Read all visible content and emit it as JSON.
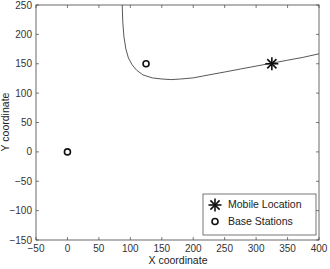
{
  "chart_data": {
    "type": "scatter",
    "title": "",
    "xlabel": "X coordinate",
    "ylabel": "Y coordinate",
    "xlim": [
      -50,
      400
    ],
    "ylim": [
      -150,
      250
    ],
    "xticks": [
      -50,
      0,
      50,
      100,
      150,
      200,
      250,
      300,
      350,
      400
    ],
    "yticks": [
      -150,
      -100,
      -50,
      0,
      50,
      100,
      150,
      200,
      250
    ],
    "xtick_labels": [
      "−50",
      "0",
      "50",
      "100",
      "150",
      "200",
      "250",
      "300",
      "350",
      "400"
    ],
    "ytick_labels": [
      "−150",
      "−100",
      "−50",
      "0",
      "50",
      "100",
      "150",
      "200",
      "250"
    ],
    "grid": false,
    "legend_position": "lower right",
    "series": [
      {
        "name": "Mobile Location",
        "marker": "asterisk",
        "color": "#111111",
        "points": [
          [
            325,
            150
          ]
        ]
      },
      {
        "name": "Base Stations",
        "marker": "circle-open",
        "color": "#111111",
        "points": [
          [
            0,
            0
          ],
          [
            125,
            150
          ]
        ]
      },
      {
        "name": "Hyperbola",
        "in_legend": false,
        "style": "line",
        "color": "#444444",
        "points": [
          [
            87,
            250
          ],
          [
            88,
            220
          ],
          [
            90,
            195
          ],
          [
            93,
            175
          ],
          [
            97,
            160
          ],
          [
            103,
            148
          ],
          [
            110,
            139
          ],
          [
            120,
            131
          ],
          [
            135,
            126
          ],
          [
            150,
            124
          ],
          [
            165,
            123
          ],
          [
            180,
            124
          ],
          [
            200,
            126
          ],
          [
            225,
            131
          ],
          [
            250,
            136
          ],
          [
            275,
            141
          ],
          [
            300,
            146
          ],
          [
            325,
            151
          ],
          [
            350,
            156
          ],
          [
            375,
            161
          ],
          [
            400,
            167
          ]
        ]
      }
    ],
    "legend": {
      "entries": [
        "Mobile Location",
        "Base Stations"
      ]
    }
  }
}
